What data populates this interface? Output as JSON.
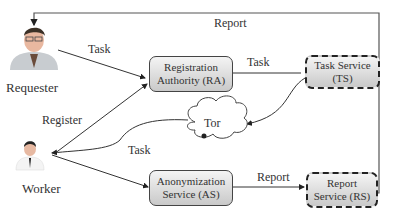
{
  "actors": {
    "requester": {
      "label": "Requester",
      "icon": "requester-person-icon"
    },
    "worker": {
      "label": "Worker",
      "icon": "worker-person-icon"
    }
  },
  "nodes": {
    "ra": {
      "line1": "Registration",
      "line2": "Authority (RA)"
    },
    "ts": {
      "line1": "Task Service",
      "line2": "(TS)"
    },
    "as": {
      "line1": "Anonymization",
      "line2": "Service (AS)"
    },
    "rs": {
      "line1": "Report",
      "line2": "Service (RS)"
    },
    "tor": {
      "label": "Tor",
      "icon": "cloud-icon"
    }
  },
  "edges": {
    "requester_to_ra": "Task",
    "ra_to_ts": "Task",
    "rs_to_requester": "Report",
    "worker_to_ra": "Register",
    "tor_to_worker": "Task",
    "as_to_rs": "Report"
  }
}
